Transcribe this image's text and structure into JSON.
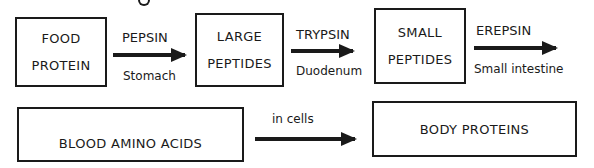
{
  "diagram": {
    "row1": {
      "box1": {
        "line1": "FOOD",
        "line2": "PROTEIN"
      },
      "arrow1": {
        "enzyme": "PEPSIN",
        "site": "Stomach"
      },
      "box2": {
        "line1": "LARGE",
        "line2": "PEPTIDES"
      },
      "arrow2": {
        "enzyme": "TRYPSIN",
        "site": "Duodenum"
      },
      "box3": {
        "line1": "SMALL",
        "line2": "PEPTIDES"
      },
      "arrow3": {
        "enzyme": "EREPSIN",
        "site": "Small intestine"
      }
    },
    "row2": {
      "box4": {
        "label": "BLOOD AMINO ACIDS"
      },
      "arrow4": {
        "label": "in cells"
      },
      "box5": {
        "label": "BODY PROTEINS"
      }
    }
  }
}
